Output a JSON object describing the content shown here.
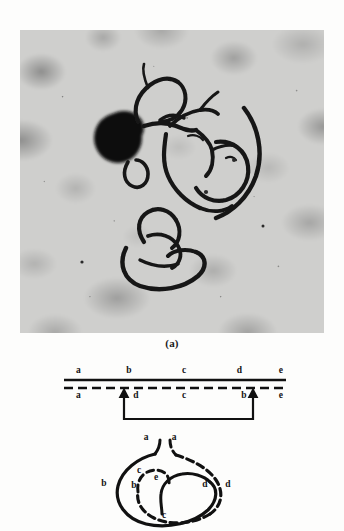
{
  "figure": {
    "panel_a_label": "(a)",
    "micrograph": {
      "icon": "chromosome-micrograph",
      "description": "light-microscope field of spread chromosomes with dark staining nucleolus",
      "background_color": "#cfcfcd",
      "filament_color": "#1b1b1b"
    }
  },
  "linear_diagram": {
    "name": "inversion-linear-diagram",
    "line_color": "#111111",
    "top_strand": {
      "style": "solid",
      "segments": [
        {
          "label": "a",
          "x_pct": 8
        },
        {
          "label": "b",
          "x_pct": 30
        },
        {
          "label": "c",
          "x_pct": 54
        },
        {
          "label": "d",
          "x_pct": 78
        },
        {
          "label": "e",
          "x_pct": 96
        }
      ]
    },
    "bottom_strand": {
      "style": "dashed",
      "segments": [
        {
          "label": "a",
          "x_pct": 8
        },
        {
          "label": "d",
          "x_pct": 33
        },
        {
          "label": "c",
          "x_pct": 54
        },
        {
          "label": "b",
          "x_pct": 80
        },
        {
          "label": "e",
          "x_pct": 96
        }
      ]
    },
    "breakpoint_arrows": [
      {
        "x_pct": 28
      },
      {
        "x_pct": 84
      }
    ],
    "bracket": {
      "from_x_pct": 28,
      "to_x_pct": 84
    }
  },
  "loop_diagram": {
    "name": "inversion-loop-diagram",
    "solid_strand_color": "#111111",
    "dashed_strand_color": "#111111",
    "labels": [
      {
        "label": "a",
        "x": 48,
        "y": 14,
        "role": "solid-arm-top-left"
      },
      {
        "label": "a",
        "x": 76,
        "y": 14,
        "role": "dashed-arm-top-right"
      },
      {
        "label": "b",
        "x": 6,
        "y": 60,
        "role": "solid-left-outer"
      },
      {
        "label": "b",
        "x": 36,
        "y": 62,
        "role": "dashed-left-inner"
      },
      {
        "label": "c",
        "x": 41,
        "y": 47,
        "role": "dashed-loop-upper"
      },
      {
        "label": "e",
        "x": 58,
        "y": 54,
        "role": "solid-loop-center"
      },
      {
        "label": "c",
        "x": 66,
        "y": 92,
        "role": "dashed-loop-bottom"
      },
      {
        "label": "d",
        "x": 107,
        "y": 61,
        "role": "solid-right-inner"
      },
      {
        "label": "d",
        "x": 130,
        "y": 61,
        "role": "dashed-right-outer"
      }
    ]
  }
}
